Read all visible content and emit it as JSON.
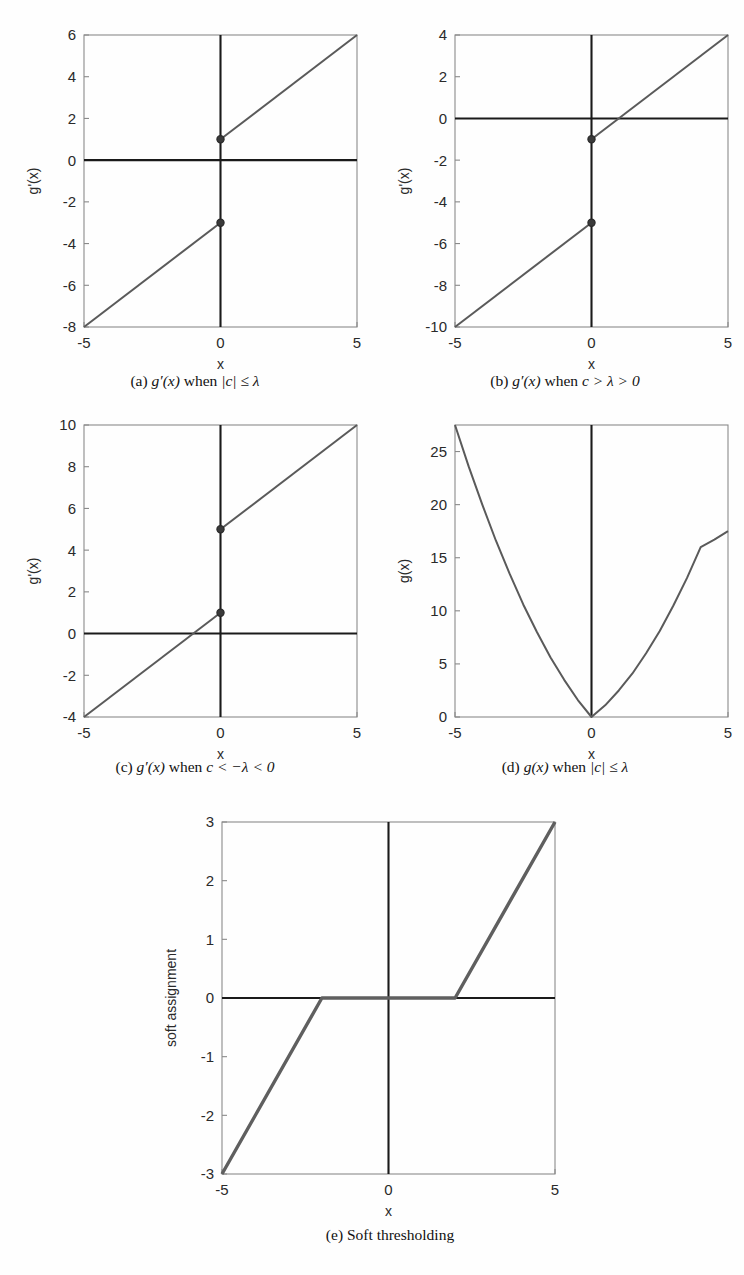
{
  "figure": {
    "panel_count": 5,
    "line_color": "#5a5a5a",
    "axis_color": "#1a1a1a",
    "frame_color": "#8a8a8a"
  },
  "panels": [
    {
      "id": "a",
      "caption_prefix": "(a)",
      "caption_func": "g′(x)",
      "caption_when": "when",
      "caption_cond": "|c| ≤ λ",
      "caption_plain": "(a) g′(x) when |c| ≤ λ",
      "xlabel": "x",
      "ylabel": "g'(x)",
      "xticks": [
        -5,
        0,
        5
      ],
      "xtick_labels": [
        "-5",
        "0",
        "5"
      ],
      "yticks": [
        -8,
        -6,
        -4,
        -2,
        0,
        2,
        4,
        6
      ],
      "ytick_labels": [
        "-8",
        "-6",
        "-4",
        "-2",
        "0",
        "2",
        "4",
        "6"
      ],
      "xlim": [
        -5,
        5
      ],
      "ylim": [
        -8,
        6
      ],
      "segments": [
        {
          "name": "lower-branch",
          "points": [
            [
              -5,
              -8
            ],
            [
              0,
              -3
            ]
          ]
        },
        {
          "name": "upper-branch",
          "points": [
            [
              0,
              1
            ],
            [
              5,
              6
            ]
          ]
        }
      ],
      "markers": [
        [
          0,
          1
        ],
        [
          0,
          -3
        ]
      ],
      "zero_h": 0,
      "zero_v": 0
    },
    {
      "id": "b",
      "caption_prefix": "(b)",
      "caption_func": "g′(x)",
      "caption_when": "when",
      "caption_cond": "c > λ > 0",
      "caption_plain": "(b) g′(x) when c > λ > 0",
      "xlabel": "x",
      "ylabel": "g'(x)",
      "xticks": [
        -5,
        0,
        5
      ],
      "xtick_labels": [
        "-5",
        "0",
        "5"
      ],
      "yticks": [
        -10,
        -8,
        -6,
        -4,
        -2,
        0,
        2,
        4
      ],
      "ytick_labels": [
        "-10",
        "-8",
        "-6",
        "-4",
        "-2",
        "0",
        "2",
        "4"
      ],
      "xlim": [
        -5,
        5
      ],
      "ylim": [
        -10,
        4
      ],
      "segments": [
        {
          "name": "lower-branch",
          "points": [
            [
              -5,
              -10
            ],
            [
              0,
              -5
            ]
          ]
        },
        {
          "name": "upper-branch",
          "points": [
            [
              0,
              -1
            ],
            [
              5,
              4
            ]
          ]
        }
      ],
      "markers": [
        [
          0,
          -1
        ],
        [
          0,
          -5
        ]
      ],
      "zero_h": 0,
      "zero_v": 0
    },
    {
      "id": "c",
      "caption_prefix": "(c)",
      "caption_func": "g′(x)",
      "caption_when": "when",
      "caption_cond": "c < −λ < 0",
      "caption_plain": "(c) g′(x) when c < −λ < 0",
      "xlabel": "x",
      "ylabel": "g'(x)",
      "xticks": [
        -5,
        0,
        5
      ],
      "xtick_labels": [
        "-5",
        "0",
        "5"
      ],
      "yticks": [
        -4,
        -2,
        0,
        2,
        4,
        6,
        8,
        10
      ],
      "ytick_labels": [
        "-4",
        "-2",
        "0",
        "2",
        "4",
        "6",
        "8",
        "10"
      ],
      "xlim": [
        -5,
        5
      ],
      "ylim": [
        -4,
        10
      ],
      "segments": [
        {
          "name": "lower-branch",
          "points": [
            [
              -5,
              -4
            ],
            [
              0,
              1
            ]
          ]
        },
        {
          "name": "upper-branch",
          "points": [
            [
              0,
              5
            ],
            [
              5,
              10
            ]
          ]
        }
      ],
      "markers": [
        [
          0,
          5
        ],
        [
          0,
          1
        ]
      ],
      "zero_h": 0,
      "zero_v": 0
    },
    {
      "id": "d",
      "caption_prefix": "(d)",
      "caption_func": "g(x)",
      "caption_when": "when",
      "caption_cond": "|c| ≤ λ",
      "caption_plain": "(d) g(x) when |c| ≤ λ",
      "xlabel": "x",
      "ylabel": "g(x)",
      "xticks": [
        -5,
        0,
        5
      ],
      "xtick_labels": [
        "-5",
        "0",
        "5"
      ],
      "yticks": [
        0,
        5,
        10,
        15,
        20,
        25
      ],
      "ytick_labels": [
        "0",
        "5",
        "10",
        "15",
        "20",
        "25"
      ],
      "xlim": [
        -5,
        5
      ],
      "ylim": [
        0,
        27.5
      ],
      "curve": {
        "name": "parabola",
        "points": [
          [
            -5,
            27.5
          ],
          [
            -4.5,
            23.6
          ],
          [
            -4,
            20.0
          ],
          [
            -3.5,
            16.6
          ],
          [
            -3,
            13.5
          ],
          [
            -2.5,
            10.6
          ],
          [
            -2,
            8.0
          ],
          [
            -1.5,
            5.6
          ],
          [
            -1,
            3.5
          ],
          [
            -0.5,
            1.6
          ],
          [
            0,
            0
          ],
          [
            0.5,
            1.1
          ],
          [
            1,
            2.5
          ],
          [
            1.5,
            4.1
          ],
          [
            2,
            6.0
          ],
          [
            2.5,
            8.1
          ],
          [
            3,
            10.5
          ],
          [
            3.5,
            13.1
          ],
          [
            4,
            16.0
          ],
          [
            4.5,
            16.7
          ],
          [
            5,
            17.5
          ]
        ]
      },
      "zero_v": 0
    },
    {
      "id": "e",
      "caption_prefix": "(e)",
      "caption_func": "",
      "caption_when": "",
      "caption_cond": "",
      "caption_plain": "(e) Soft thresholding",
      "caption_text": "Soft thresholding",
      "xlabel": "x",
      "ylabel": "soft assignment",
      "xticks": [
        -5,
        0,
        5
      ],
      "xtick_labels": [
        "-5",
        "0",
        "5"
      ],
      "yticks": [
        -3,
        -2,
        -1,
        0,
        1,
        2,
        3
      ],
      "ytick_labels": [
        "-3",
        "-2",
        "-1",
        "0",
        "1",
        "2",
        "3"
      ],
      "xlim": [
        -5,
        5
      ],
      "ylim": [
        -3,
        3
      ],
      "threshold": 2,
      "segments": [
        {
          "name": "soft-threshold-curve",
          "points": [
            [
              -5,
              -3
            ],
            [
              -2,
              0
            ],
            [
              2,
              0
            ],
            [
              5,
              3
            ]
          ]
        }
      ],
      "zero_h": 0,
      "zero_v": 0
    }
  ],
  "chart_data": [
    {
      "type": "line",
      "id": "a",
      "title": "(a) g'(x) when |c| <= lambda",
      "xlabel": "x",
      "ylabel": "g'(x)",
      "xlim": [
        -5,
        5
      ],
      "ylim": [
        -8,
        6
      ],
      "grid": false,
      "legend": "none",
      "xticks": [
        -5,
        0,
        5
      ],
      "yticks": [
        -8,
        -6,
        -4,
        -2,
        0,
        2,
        4,
        6
      ],
      "series": [
        {
          "name": "lower branch (x<0)",
          "x": [
            -5,
            0
          ],
          "y": [
            -8,
            -3
          ]
        },
        {
          "name": "upper branch (x>0)",
          "x": [
            0,
            5
          ],
          "y": [
            1,
            6
          ]
        }
      ],
      "annotations": [
        {
          "name": "open-jump-upper",
          "x": 0,
          "y": 1
        },
        {
          "name": "open-jump-lower",
          "x": 0,
          "y": -3
        }
      ],
      "notes": "slope 1, jump discontinuity at x=0 from -3 to 1"
    },
    {
      "type": "line",
      "id": "b",
      "title": "(b) g'(x) when c > lambda > 0",
      "xlabel": "x",
      "ylabel": "g'(x)",
      "xlim": [
        -5,
        5
      ],
      "ylim": [
        -10,
        4
      ],
      "grid": false,
      "legend": "none",
      "xticks": [
        -5,
        0,
        5
      ],
      "yticks": [
        -10,
        -8,
        -6,
        -4,
        -2,
        0,
        2,
        4
      ],
      "series": [
        {
          "name": "lower branch (x<0)",
          "x": [
            -5,
            0
          ],
          "y": [
            -10,
            -5
          ]
        },
        {
          "name": "upper branch (x>0)",
          "x": [
            0,
            5
          ],
          "y": [
            -1,
            4
          ]
        }
      ],
      "annotations": [
        {
          "name": "jump-upper",
          "x": 0,
          "y": -1
        },
        {
          "name": "jump-lower",
          "x": 0,
          "y": -5
        }
      ],
      "notes": "slope 1, jump discontinuity at x=0 from -5 to -1; upper branch crosses zero at x=1"
    },
    {
      "type": "line",
      "id": "c",
      "title": "(c) g'(x) when c < -lambda < 0",
      "xlabel": "x",
      "ylabel": "g'(x)",
      "xlim": [
        -5,
        5
      ],
      "ylim": [
        -4,
        10
      ],
      "grid": false,
      "legend": "none",
      "xticks": [
        -5,
        0,
        5
      ],
      "yticks": [
        -4,
        -2,
        0,
        2,
        4,
        6,
        8,
        10
      ],
      "series": [
        {
          "name": "lower branch (x<0)",
          "x": [
            -5,
            0
          ],
          "y": [
            -4,
            1
          ]
        },
        {
          "name": "upper branch (x>0)",
          "x": [
            0,
            5
          ],
          "y": [
            5,
            10
          ]
        }
      ],
      "annotations": [
        {
          "name": "jump-upper",
          "x": 0,
          "y": 5
        },
        {
          "name": "jump-lower",
          "x": 0,
          "y": 1
        }
      ],
      "notes": "slope 1, jump discontinuity at x=0 from 1 to 5; lower branch crosses zero at x=-1"
    },
    {
      "type": "line",
      "id": "d",
      "title": "(d) g(x) when |c| <= lambda",
      "xlabel": "x",
      "ylabel": "g(x)",
      "xlim": [
        -5,
        5
      ],
      "ylim": [
        0,
        27.5
      ],
      "grid": false,
      "legend": "none",
      "xticks": [
        -5,
        0,
        5
      ],
      "yticks": [
        0,
        5,
        10,
        15,
        20,
        25
      ],
      "series": [
        {
          "name": "g(x)",
          "x": [
            -5,
            -4,
            -3,
            -2,
            -1,
            0,
            1,
            2,
            3,
            4,
            5
          ],
          "y": [
            27.5,
            20.0,
            13.5,
            8.0,
            3.5,
            0,
            2.5,
            6.0,
            10.5,
            16.0,
            17.5
          ]
        }
      ],
      "notes": "convex piecewise-quadratic with minimum 0 at x=0; left arm rises to 27.5 at x=-5, right arm to 17.5 at x=5"
    },
    {
      "type": "line",
      "id": "e",
      "title": "(e) Soft thresholding",
      "xlabel": "x",
      "ylabel": "soft assignment",
      "xlim": [
        -5,
        5
      ],
      "ylim": [
        -3,
        3
      ],
      "grid": false,
      "legend": "none",
      "xticks": [
        -5,
        0,
        5
      ],
      "yticks": [
        -3,
        -2,
        -1,
        0,
        1,
        2,
        3
      ],
      "series": [
        {
          "name": "soft threshold",
          "x": [
            -5,
            -2,
            2,
            5
          ],
          "y": [
            -3,
            0,
            0,
            3
          ]
        }
      ],
      "notes": "soft thresholding operator with threshold lambda = 2; zero on [-2,2], slope 1 outside"
    }
  ]
}
